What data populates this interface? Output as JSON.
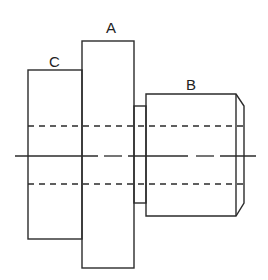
{
  "diagram": {
    "type": "technical-drawing-shaft-side-view",
    "labels": {
      "a": "A",
      "b": "B",
      "c": "C"
    },
    "colors": {
      "stroke": "#2b2b2b",
      "background": "#ffffff"
    },
    "parts": [
      {
        "id": "C",
        "shape": "rectangle",
        "x": 28,
        "y": 70,
        "width": 54,
        "height": 169
      },
      {
        "id": "A",
        "shape": "rectangle",
        "x": 82,
        "y": 41,
        "width": 52,
        "height": 227
      },
      {
        "id": "neck",
        "shape": "rectangle",
        "x": 134,
        "y": 106,
        "width": 12,
        "height": 97
      },
      {
        "id": "B",
        "shape": "rectangle-with-chamfer",
        "x": 146,
        "y": 94,
        "width": 90,
        "height": 122,
        "chamfer_end_x": 244
      }
    ],
    "hidden_lines_y": [
      126,
      184
    ],
    "centerline_y": 156
  }
}
